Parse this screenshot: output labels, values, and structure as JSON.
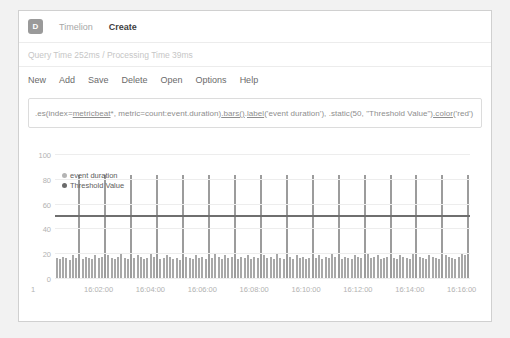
{
  "navbar": {
    "logo": "D",
    "logo_name": "app-logo-badge",
    "items": [
      {
        "label": "Timelion",
        "active": false
      },
      {
        "label": "Create",
        "active": true
      }
    ]
  },
  "timing": {
    "text": "Query Time 252ms / Processing Time 39ms"
  },
  "menu": {
    "items": [
      "New",
      "Add",
      "Save",
      "Delete",
      "Open",
      "Options",
      "Help"
    ]
  },
  "expression": {
    "value": ".es(index=metricbeat*, metric=count:event.duration).bars().label('event duration'), .static(50, \"Threshold Value\").color('red')",
    "placeholder": "Enter a timelion expression",
    "segments": [
      {
        "text": ".es(index=",
        "underline": false
      },
      {
        "text": "metricbeat",
        "underline": true
      },
      {
        "text": "*, metric=count:event.duration)",
        "underline": false
      },
      {
        "text": ".bars()",
        "underline": true
      },
      {
        "text": ".",
        "underline": false
      },
      {
        "text": "label",
        "underline": true
      },
      {
        "text": "('event duration'), .static(50, \"Threshold Value\")",
        "underline": false
      },
      {
        "text": ".color",
        "underline": true
      },
      {
        "text": "('red')",
        "underline": false
      }
    ]
  },
  "chart_data": {
    "type": "bar",
    "title": "",
    "xlabel": "",
    "ylabel": "",
    "ylim": [
      0,
      100
    ],
    "yticks": [
      0,
      20,
      40,
      60,
      80,
      100
    ],
    "ytick_labels": [
      "0",
      "20",
      "40",
      "60",
      "80",
      "100"
    ],
    "x_origin_label": "1",
    "xtick_labels": [
      "16:02:00",
      "16:04:00",
      "16:06:00",
      "16:08:00",
      "16:10:00",
      "16:12:00",
      "16:14:00",
      "16:16:00"
    ],
    "xtick_positions_pct": [
      10.5,
      23.0,
      35.5,
      48.0,
      60.5,
      73.0,
      85.5,
      98.0
    ],
    "grid": true,
    "legend_position": "top-left",
    "series": [
      {
        "name": "event duration",
        "type": "bar",
        "color": "#a8a8a8",
        "values": [
          17,
          16,
          18,
          17,
          15,
          19,
          17,
          84,
          16,
          18,
          17,
          16,
          19,
          17,
          18,
          84,
          19,
          17,
          16,
          18,
          20,
          17,
          16,
          84,
          17,
          19,
          18,
          16,
          17,
          20,
          18,
          84,
          16,
          17,
          19,
          18,
          16,
          17,
          15,
          84,
          18,
          17,
          16,
          19,
          17,
          18,
          16,
          84,
          17,
          20,
          18,
          16,
          19,
          17,
          18,
          84,
          16,
          18,
          17,
          19,
          16,
          18,
          17,
          84,
          19,
          17,
          18,
          16,
          20,
          17,
          16,
          84,
          18,
          16,
          19,
          17,
          18,
          16,
          17,
          84,
          17,
          19,
          16,
          18,
          17,
          20,
          18,
          84,
          16,
          18,
          17,
          16,
          19,
          18,
          17,
          84,
          20,
          17,
          18,
          19,
          16,
          17,
          18,
          84,
          17,
          16,
          19,
          18,
          17,
          16,
          20,
          84,
          18,
          17,
          16,
          19,
          18,
          17,
          16,
          84,
          19,
          18,
          17,
          16,
          18,
          20,
          19,
          84
        ]
      },
      {
        "name": "Threshold Value",
        "type": "line",
        "color": "#6f6f6f",
        "constant_value": 50
      }
    ],
    "legend": [
      {
        "label": "event duration",
        "color": "#b4b4b4"
      },
      {
        "label": "Threshold Value",
        "color": "#6b6b6b"
      }
    ]
  }
}
